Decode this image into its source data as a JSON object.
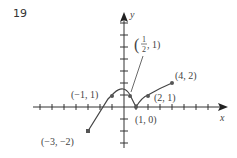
{
  "problem_number": "19",
  "axes": {
    "x_label": "x",
    "y_label": "y",
    "origin_px": [
      124,
      107
    ],
    "unit_px": 12,
    "x_range": [
      -7,
      8
    ],
    "y_range": [
      -3,
      7
    ]
  },
  "points": [
    {
      "label": "(−3, −2)",
      "x": -3,
      "y": -2
    },
    {
      "label": "(−1, 1)",
      "x": -1,
      "y": 1
    },
    {
      "label": "(1/2, 1)",
      "x": 0.5,
      "y": 1
    },
    {
      "label": "(1, 0)",
      "x": 1,
      "y": 0
    },
    {
      "label": "(2, 1)",
      "x": 2,
      "y": 1
    },
    {
      "label": "(4, 2)",
      "x": 4,
      "y": 2
    }
  ],
  "labels": {
    "p1": "(−3, −2)",
    "p2": "(−1, 1)",
    "p3_num": "1",
    "p3_den": "2",
    "p3_rest": ", 1)",
    "p4": "(1, 0)",
    "p5": "(2, 1)",
    "p6": "(4, 2)"
  },
  "colors": {
    "axis": "#333333",
    "curve": "#444444",
    "dot": "#555555"
  }
}
